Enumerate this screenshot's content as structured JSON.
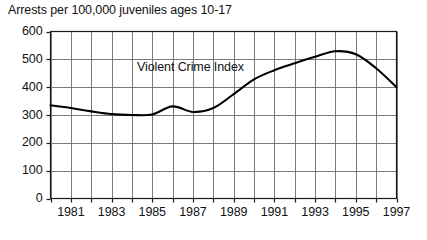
{
  "chart_data": {
    "type": "line",
    "title": "Arrests per 100,000 juveniles ages 10-17",
    "xlabel": "",
    "ylabel": "",
    "xlim": [
      1980,
      1997
    ],
    "ylim": [
      0,
      600
    ],
    "grid": true,
    "legend": "none",
    "annotations": [
      {
        "text": "Violent Crime Index",
        "x": 1987.1,
        "y": 468
      }
    ],
    "ytick_values": [
      0,
      100,
      200,
      300,
      400,
      500,
      600
    ],
    "ytick_labels": [
      "0",
      "100",
      "200",
      "300",
      "400",
      "500",
      "600"
    ],
    "xtick_values": [
      1981,
      1983,
      1985,
      1987,
      1989,
      1991,
      1993,
      1995,
      1997
    ],
    "xtick_labels": [
      "1981",
      "1983",
      "1985",
      "1987",
      "1989",
      "1991",
      "1993",
      "1995",
      "1997"
    ],
    "xgrid_values": [
      1980,
      1981,
      1982,
      1983,
      1984,
      1985,
      1986,
      1987,
      1988,
      1989,
      1990,
      1991,
      1992,
      1993,
      1994,
      1995,
      1996,
      1997
    ],
    "series": [
      {
        "name": "Violent Crime Index",
        "color": "#000000",
        "x": [
          1980,
          1981,
          1982,
          1983,
          1984,
          1985,
          1986,
          1987,
          1988,
          1989,
          1990,
          1991,
          1992,
          1993,
          1994,
          1995,
          1996,
          1997
        ],
        "values": [
          335,
          325,
          313,
          303,
          300,
          302,
          331,
          311,
          325,
          375,
          428,
          461,
          486,
          509,
          529,
          518,
          468,
          400
        ]
      }
    ]
  },
  "colors": {
    "line": "#000000",
    "grid": "#7a7a7a",
    "axis": "#1a1a1a",
    "background": "#ffffff",
    "text": "#111111"
  }
}
